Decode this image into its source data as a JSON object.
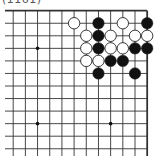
{
  "caption": "(1161)",
  "board": {
    "description": "Go problem diagram, upper-right corner of a 19x19 board",
    "visible_columns": 12,
    "visible_rows": 12,
    "edges": [
      "top",
      "right"
    ],
    "line_color": "#333333",
    "black_color": "#111111",
    "white_color": "#ffffff",
    "star_points": [
      {
        "col": 2,
        "row": 3
      },
      {
        "col": 2,
        "row": 9
      },
      {
        "col": 8,
        "row": 9
      }
    ],
    "stones": [
      {
        "color": "white",
        "col": 5,
        "row": 1
      },
      {
        "color": "black",
        "col": 7,
        "row": 1
      },
      {
        "color": "white",
        "col": 9,
        "row": 1
      },
      {
        "color": "black",
        "col": 11,
        "row": 1
      },
      {
        "color": "white",
        "col": 6,
        "row": 2
      },
      {
        "color": "black",
        "col": 7,
        "row": 2
      },
      {
        "color": "white",
        "col": 8,
        "row": 2
      },
      {
        "color": "white",
        "col": 10,
        "row": 2
      },
      {
        "color": "white",
        "col": 11,
        "row": 2
      },
      {
        "color": "white",
        "col": 6,
        "row": 3
      },
      {
        "color": "black",
        "col": 7,
        "row": 3
      },
      {
        "color": "white",
        "col": 8,
        "row": 3
      },
      {
        "color": "white",
        "col": 9,
        "row": 3
      },
      {
        "color": "black",
        "col": 10,
        "row": 3
      },
      {
        "color": "black",
        "col": 11,
        "row": 3
      },
      {
        "color": "white",
        "col": 6,
        "row": 4
      },
      {
        "color": "white",
        "col": 7,
        "row": 4
      },
      {
        "color": "black",
        "col": 8,
        "row": 4
      },
      {
        "color": "black",
        "col": 9,
        "row": 4
      },
      {
        "color": "black",
        "col": 7,
        "row": 5
      },
      {
        "color": "black",
        "col": 10,
        "row": 5
      }
    ]
  }
}
